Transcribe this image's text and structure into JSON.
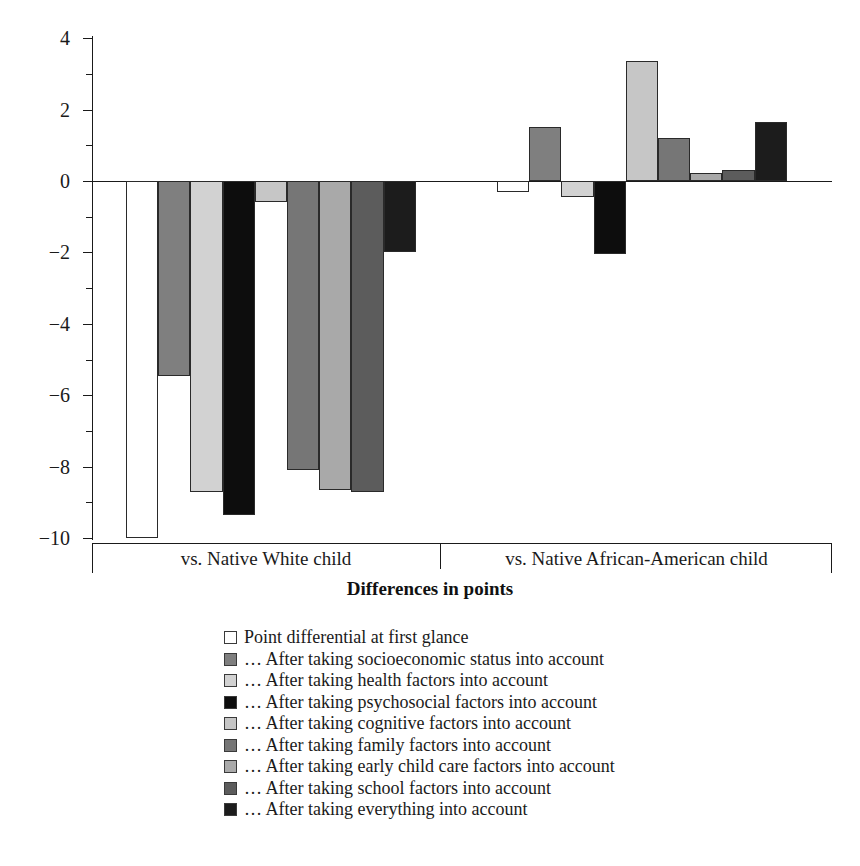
{
  "chart_data": {
    "type": "bar",
    "title": "",
    "xlabel": "Differences in points",
    "ylabel": "",
    "ylim": [
      -10,
      4
    ],
    "yticks": [
      4,
      2,
      0,
      -2,
      -4,
      -6,
      -8,
      -10
    ],
    "ytick_labels": [
      "4",
      "2",
      "0",
      "−2",
      "−4",
      "−6",
      "−8",
      "−10"
    ],
    "grid": false,
    "legend_position": "bottom",
    "categories": [
      "vs. Native White child",
      "vs. Native African-American child"
    ],
    "series": [
      {
        "name": "Point differential at first glance",
        "color": "#ffffff",
        "values": [
          -10.0,
          -0.3
        ]
      },
      {
        "name": "… After taking socioeconomic status into account",
        "color": "#7f7f7f",
        "values": [
          -5.45,
          1.5
        ]
      },
      {
        "name": "… After taking health factors into account",
        "color": "#d2d2d2",
        "values": [
          -8.7,
          -0.45
        ]
      },
      {
        "name": "… After taking psychosocial factors into account",
        "color": "#0d0d0d",
        "values": [
          -9.35,
          -2.05
        ]
      },
      {
        "name": "… After taking cognitive factors into account",
        "color": "#c6c6c6",
        "values": [
          -0.6,
          3.35
        ]
      },
      {
        "name": "… After taking family factors into account",
        "color": "#767676",
        "values": [
          -8.1,
          1.2
        ]
      },
      {
        "name": "… After taking early child care factors into account",
        "color": "#a9a9a9",
        "values": [
          -8.65,
          0.22
        ]
      },
      {
        "name": "… After taking school factors into account",
        "color": "#5c5c5c",
        "values": [
          -8.7,
          0.3
        ]
      },
      {
        "name": "… After taking everything into account",
        "color": "#1c1c1c",
        "values": [
          -2.0,
          1.65
        ]
      }
    ]
  },
  "axis": {
    "y_ticks": [
      {
        "label": "4",
        "value": 4
      },
      {
        "label": "2",
        "value": 2
      },
      {
        "label": "0",
        "value": 0
      },
      {
        "label": "−2",
        "value": -2
      },
      {
        "label": "−4",
        "value": -4
      },
      {
        "label": "−6",
        "value": -6
      },
      {
        "label": "−8",
        "value": -8
      },
      {
        "label": "−10",
        "value": -10
      }
    ],
    "title": "Differences in points"
  },
  "groups": [
    {
      "label": "vs. Native White child"
    },
    {
      "label": "vs. Native African-American child"
    }
  ],
  "legend": {
    "items": [
      {
        "label": "Point differential at first glance",
        "color": "#ffffff"
      },
      {
        "label": "… After taking socioeconomic status into account",
        "color": "#7f7f7f"
      },
      {
        "label": "… After taking health factors into account",
        "color": "#d2d2d2"
      },
      {
        "label": "… After taking psychosocial factors into account",
        "color": "#0d0d0d"
      },
      {
        "label": "… After taking cognitive factors into account",
        "color": "#c6c6c6"
      },
      {
        "label": "… After taking family factors into account",
        "color": "#767676"
      },
      {
        "label": "… After taking early child care factors into account",
        "color": "#a9a9a9"
      },
      {
        "label": "… After taking school factors into account",
        "color": "#5c5c5c"
      },
      {
        "label": "… After taking everything into account",
        "color": "#1c1c1c"
      }
    ]
  }
}
